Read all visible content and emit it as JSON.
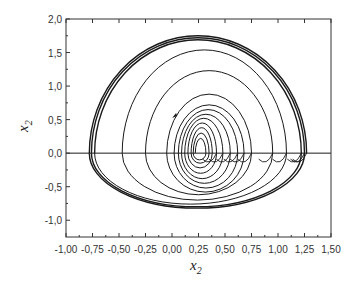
{
  "chart_data": {
    "type": "line",
    "title": "",
    "xlabel": "x2",
    "ylabel": "x2",
    "xlim": [
      -1.0,
      1.5
    ],
    "ylim": [
      -1.25,
      2.0
    ],
    "xticks": [
      -1.0,
      -0.75,
      -0.5,
      -0.25,
      0.0,
      0.25,
      0.5,
      0.75,
      1.0,
      1.25,
      1.5
    ],
    "xtick_labels": [
      "-1,00",
      "-0,75",
      "-0,50",
      "-0,25",
      "0,00",
      "0,25",
      "0,50",
      "0,75",
      "1,00",
      "1,25",
      "1,50"
    ],
    "yticks": [
      -1.0,
      -0.5,
      0.0,
      0.5,
      1.0,
      1.5,
      2.0
    ],
    "ytick_labels": [
      "-1,0",
      "-0,5",
      "0,0",
      "0,5",
      "1,0",
      "1,5",
      "2,0"
    ],
    "grid": false,
    "legend": null,
    "reference_line": {
      "y": 0.0
    },
    "series": [
      {
        "name": "phase trajectory",
        "description": "spiral of loops crossing the x-axis; each loop: upper arc from left crossing xl to right crossing xr with height top, lower arc back with depth bottom",
        "loops": [
          {
            "xl": 0.22,
            "xr": 0.32,
            "top": 0.22,
            "bottom": 0.1
          },
          {
            "xl": 0.2,
            "xr": 0.35,
            "top": 0.3,
            "bottom": 0.15
          },
          {
            "xl": 0.18,
            "xr": 0.38,
            "top": 0.38,
            "bottom": 0.22
          },
          {
            "xl": 0.15,
            "xr": 0.42,
            "top": 0.45,
            "bottom": 0.3
          },
          {
            "xl": 0.12,
            "xr": 0.48,
            "top": 0.52,
            "bottom": 0.38
          },
          {
            "xl": 0.09,
            "xr": 0.55,
            "top": 0.58,
            "bottom": 0.45
          },
          {
            "xl": 0.06,
            "xr": 0.62,
            "top": 0.65,
            "bottom": 0.52
          },
          {
            "xl": 0.02,
            "xr": 0.68,
            "top": 0.72,
            "bottom": 0.58
          },
          {
            "xl": -0.05,
            "xr": 0.75,
            "top": 0.88,
            "bottom": 0.62
          },
          {
            "xl": -0.25,
            "xr": 0.95,
            "top": 1.23,
            "bottom": 0.7
          },
          {
            "xl": -0.47,
            "xr": 1.08,
            "top": 1.54,
            "bottom": 0.76
          },
          {
            "xl": -0.73,
            "xr": 1.22,
            "top": 1.69,
            "bottom": 0.8
          },
          {
            "xl": -0.76,
            "xr": 1.25,
            "top": 1.72,
            "bottom": 0.82
          },
          {
            "xl": -0.78,
            "xr": 1.27,
            "top": 1.75,
            "bottom": 0.0
          }
        ],
        "marker": {
          "x": 0.02,
          "y": 0.57,
          "type": "arrow"
        }
      }
    ]
  },
  "colors": {
    "line": "#1a1a1a",
    "axis": "#333333",
    "background": "#ffffff"
  }
}
